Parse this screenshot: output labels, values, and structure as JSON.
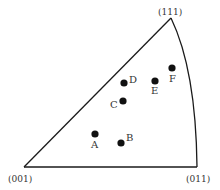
{
  "diagram": {
    "type": "stereographic-triangle",
    "vertices": [
      {
        "label": "(001)",
        "x": 24,
        "y": 167,
        "lx": 8,
        "ly": 182
      },
      {
        "label": "(011)",
        "x": 197,
        "y": 167,
        "lx": 186,
        "ly": 182
      },
      {
        "label": "(111)",
        "x": 171,
        "y": 18,
        "lx": 158,
        "ly": 15
      }
    ],
    "points": [
      {
        "label": "A",
        "x": 95,
        "y": 134,
        "lx": 91,
        "ly": 148
      },
      {
        "label": "B",
        "x": 121,
        "y": 143,
        "lx": 126,
        "ly": 141
      },
      {
        "label": "C",
        "x": 123,
        "y": 101,
        "lx": 110,
        "ly": 108
      },
      {
        "label": "D",
        "x": 124,
        "y": 83,
        "lx": 129,
        "ly": 83
      },
      {
        "label": "E",
        "x": 155,
        "y": 81,
        "lx": 151,
        "ly": 94
      },
      {
        "label": "F",
        "x": 172,
        "y": 68,
        "lx": 169,
        "ly": 82
      }
    ],
    "colors": {
      "line": "#1a1a1a",
      "dot": "#111111",
      "text": "#333333"
    }
  }
}
